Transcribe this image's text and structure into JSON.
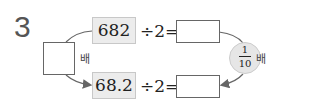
{
  "problem": {
    "number": "3",
    "top_value": "682",
    "bottom_value": "68.2",
    "operation": "÷2=",
    "left_label": "배",
    "circle": {
      "numerator": "1",
      "denominator": "10",
      "unit": "배"
    }
  }
}
